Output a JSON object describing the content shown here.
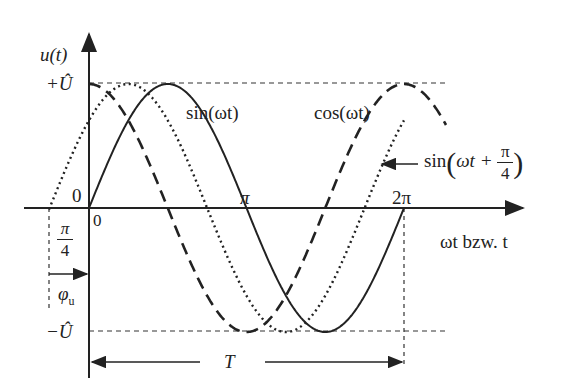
{
  "chart_data": {
    "type": "line",
    "title": "",
    "xlabel": "ωt bzw. t",
    "ylabel": "u(t)",
    "x_ticks": [
      "0",
      "π",
      "2π"
    ],
    "y_ticks": [
      "+Û",
      "0",
      "−Û"
    ],
    "x_range": [
      "−π/4",
      "2π"
    ],
    "y_range": [
      -1,
      1
    ],
    "grid": false,
    "series": [
      {
        "name": "sin(ωt)",
        "style": "solid",
        "phase": 0
      },
      {
        "name": "cos(ωt)",
        "style": "dashed",
        "phase": "π/2"
      },
      {
        "name": "sin(ωt + π/4)",
        "style": "dotted",
        "phase": "π/4"
      }
    ],
    "annotations": [
      "φu = π/4",
      "T (period from 0 to 2π)"
    ]
  },
  "labels": {
    "y_axis": "u(t)",
    "plus_amp": "+Û",
    "minus_amp": "−Û",
    "zero_left": "0",
    "zero_origin": "0",
    "pi": "π",
    "two_pi": "2π",
    "x_axis": "ωt bzw. t",
    "sin_label": "sin(ωt)",
    "cos_label": "cos(ωt)",
    "shifted_label_func": "sin",
    "shifted_label_arg": "ωt +",
    "shifted_num": "π",
    "shifted_den": "4",
    "phase_num": "π",
    "phase_den": "4",
    "phase_symbol": "φ",
    "phase_sub": "u",
    "period": "T"
  }
}
